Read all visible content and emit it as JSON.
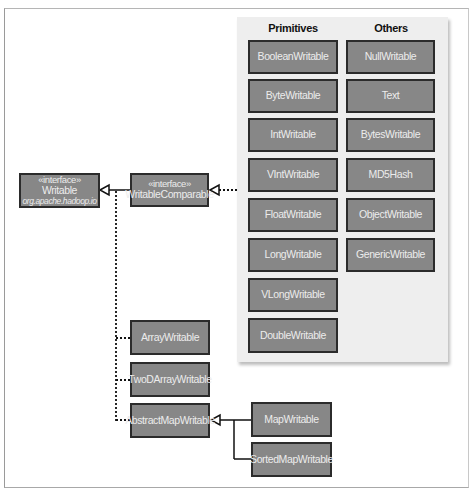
{
  "diagram": {
    "interfaces": {
      "writable": {
        "stereotype": "«interface»",
        "name": "Writable",
        "package": "org.apache.hadoop.io"
      },
      "writable_comparable": {
        "stereotype": "«interface»",
        "name": "WritableComparable"
      }
    },
    "panel": {
      "primitives_header": "Primitives",
      "others_header": "Others",
      "primitives": [
        "BooleanWritable",
        "ByteWritable",
        "IntWritable",
        "VIntWritable",
        "FloatWritable",
        "LongWritable",
        "VLongWritable",
        "DoubleWritable"
      ],
      "others": [
        "NullWritable",
        "Text",
        "BytesWritable",
        "MD5Hash",
        "ObjectWritable",
        "GenericWritable"
      ]
    },
    "implementations": [
      "ArrayWritable",
      "TwoDArrayWritable",
      "AbstractMapWritable"
    ],
    "map_subclasses": [
      "MapWritable",
      "SortedMapWritable"
    ],
    "colors": {
      "box_fill": "#878787",
      "box_border": "#2b2b2b",
      "box_text": "#ececec",
      "panel_bg": "#eeeeee"
    }
  }
}
